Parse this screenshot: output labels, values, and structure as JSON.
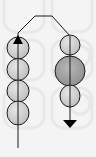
{
  "diagram": {
    "colors": {
      "background": "#f4f4f4",
      "bg_pattern": "#e9e9e9",
      "bead_fill": "#c9c9c9",
      "bead_highlight": "#e6e6e6",
      "bead_dark_fill": "#9c9c9c",
      "stroke": "#1a1a1a"
    },
    "left_string": {
      "bead_count": 4,
      "arrow_direction": "up"
    },
    "right_string": {
      "bead_count": 3,
      "large_bead_index": 1,
      "arrow_direction": "down"
    }
  }
}
